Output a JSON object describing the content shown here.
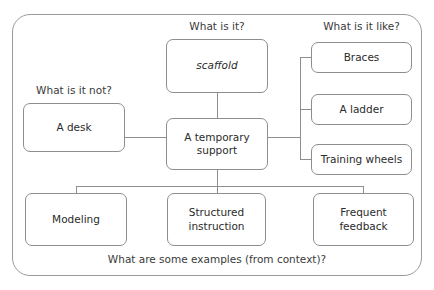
{
  "diagram": {
    "title_caption": "What are some examples (from context)?",
    "captions": {
      "what_is_it": "What is it?",
      "what_is_it_not": "What is it not?",
      "what_is_it_like": "What is it like?",
      "examples": "What are some examples (from context)?"
    },
    "nodes": {
      "term": "scaffold",
      "definition": "A temporary support",
      "non_example": "A desk",
      "similar": [
        "Braces",
        "A ladder",
        "Training wheels"
      ],
      "examples": [
        "Modeling",
        "Structured instruction",
        "Frequent feedback"
      ]
    },
    "colors": {
      "frame_border": "#9a9a9a",
      "box_border": "#8d8d8d",
      "line": "#8d8d8d",
      "text": "#2b2b2b",
      "caption_text": "#3a3a3a",
      "background": "#ffffff"
    }
  }
}
